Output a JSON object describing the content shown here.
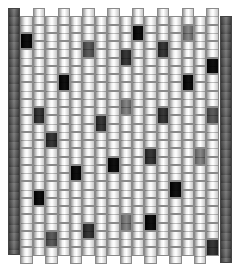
{
  "pattern": {
    "type": "bead-weave-pattern",
    "bead_width": 12.4,
    "bead_height": 16.5,
    "origin_x": 8,
    "even_col_top": 8,
    "odd_col_top": 16.3,
    "beads_per_column": 15,
    "shades": {
      "light": [
        "#9a9a9a",
        "#f2f2f2",
        "#ffffff",
        "#c8c8c8"
      ],
      "medium": [
        "#5a5a5a",
        "#7a7a7a",
        "#868686",
        "#5e5e5e"
      ],
      "medium-dark": [
        "#3c3c3c",
        "#555555",
        "#5c5c5c",
        "#404040"
      ],
      "dark": [
        "#1e1e1e",
        "#333333",
        "#383838",
        "#222222"
      ],
      "black": [
        "#000000",
        "#0c0c0c",
        "#111111",
        "#050505"
      ]
    },
    "edges": [
      {
        "name": "left-edge",
        "x": 8,
        "top": 8,
        "bottom": 255,
        "color": "#5c5c5c"
      },
      {
        "name": "right-edge",
        "x": 220,
        "top": 16,
        "bottom": 263,
        "color": "#5c5c5c"
      }
    ],
    "columns": 16,
    "colored_beads": [
      {
        "col": 1,
        "row": 1,
        "shade": "black"
      },
      {
        "col": 2,
        "row": 6,
        "shade": "dark"
      },
      {
        "col": 2,
        "row": 11,
        "shade": "black"
      },
      {
        "col": 3,
        "row": 7,
        "shade": "dark"
      },
      {
        "col": 3,
        "row": 13,
        "shade": "medium-dark"
      },
      {
        "col": 4,
        "row": 4,
        "shade": "black"
      },
      {
        "col": 5,
        "row": 9,
        "shade": "black"
      },
      {
        "col": 6,
        "row": 2,
        "shade": "medium-dark"
      },
      {
        "col": 6,
        "row": 13,
        "shade": "dark"
      },
      {
        "col": 7,
        "row": 6,
        "shade": "dark"
      },
      {
        "col": 8,
        "row": 9,
        "shade": "black"
      },
      {
        "col": 9,
        "row": 2,
        "shade": "dark"
      },
      {
        "col": 9,
        "row": 5,
        "shade": "medium"
      },
      {
        "col": 9,
        "row": 12,
        "shade": "medium"
      },
      {
        "col": 10,
        "row": 1,
        "shade": "black"
      },
      {
        "col": 11,
        "row": 8,
        "shade": "dark"
      },
      {
        "col": 11,
        "row": 12,
        "shade": "black"
      },
      {
        "col": 12,
        "row": 2,
        "shade": "dark"
      },
      {
        "col": 12,
        "row": 6,
        "shade": "dark"
      },
      {
        "col": 13,
        "row": 10,
        "shade": "black"
      },
      {
        "col": 14,
        "row": 1,
        "shade": "medium"
      },
      {
        "col": 14,
        "row": 4,
        "shade": "black"
      },
      {
        "col": 15,
        "row": 8,
        "shade": "medium"
      },
      {
        "col": 16,
        "row": 3,
        "shade": "black"
      },
      {
        "col": 16,
        "row": 6,
        "shade": "medium-dark"
      },
      {
        "col": 16,
        "row": 14,
        "shade": "dark"
      }
    ]
  }
}
